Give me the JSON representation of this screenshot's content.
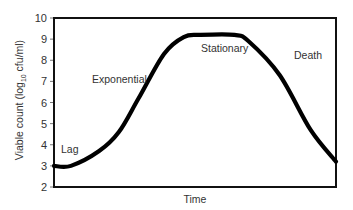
{
  "chart_data": {
    "type": "line",
    "title": "",
    "xlabel": "Time",
    "ylabel": "Viable count (log10 cfu/ml)",
    "ylabel_parts": {
      "pre": "Viable count (log",
      "sub": "10",
      "post": " cfu/ml)"
    },
    "ylim": [
      2,
      10
    ],
    "yticks": [
      2,
      3,
      4,
      5,
      6,
      7,
      8,
      9,
      10
    ],
    "xticks": [],
    "grid": false,
    "legend": null,
    "series": [
      {
        "name": "Bacterial growth curve",
        "x": [
          0,
          0.06,
          0.16,
          0.23,
          0.3,
          0.39,
          0.46,
          0.52,
          0.64,
          0.69,
          0.8,
          0.91,
          1.0
        ],
        "values": [
          3.0,
          3.0,
          3.7,
          4.6,
          6.2,
          8.3,
          9.1,
          9.2,
          9.2,
          8.9,
          7.3,
          4.7,
          3.2
        ]
      }
    ],
    "annotations": [
      {
        "text": "Lag",
        "x": 0.05,
        "y": 3.9
      },
      {
        "text": "Exponential",
        "x": 0.22,
        "y": 7.0
      },
      {
        "text": "Stationary",
        "x": 0.58,
        "y": 8.8
      },
      {
        "text": "Death",
        "x": 0.86,
        "y": 8.5
      }
    ]
  },
  "phases": {
    "lag": "Lag",
    "exponential": "Exponential",
    "stationary": "Stationary",
    "death": "Death"
  },
  "axes": {
    "x_title": "Time",
    "y_ticks": [
      "2",
      "3",
      "4",
      "5",
      "6",
      "7",
      "8",
      "9",
      "10"
    ]
  },
  "colors": {
    "curve": "#000000",
    "frame": "#111111",
    "text": "#333333"
  }
}
